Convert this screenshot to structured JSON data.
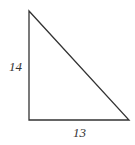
{
  "diagram": {
    "type": "right-triangle",
    "vertices": {
      "top": [
        29,
        11
      ],
      "right_angle": [
        29,
        120
      ],
      "bottom_right": [
        129,
        120
      ]
    },
    "labels": {
      "vertical_leg": "14",
      "horizontal_leg": "13"
    },
    "stroke_color": "#333333"
  }
}
